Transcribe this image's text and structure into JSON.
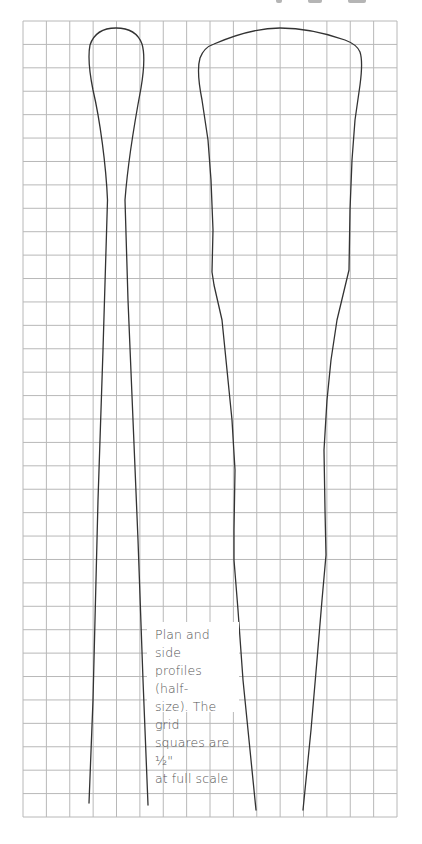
{
  "figure": {
    "caption": "Plan and side\nprofiles (half-\nsize). The grid\nsquares are ½\"\nat full scale",
    "caption_lines": [
      "Plan and side",
      "profiles (half-",
      "size). The grid",
      "squares are ½\"",
      "at full scale"
    ],
    "grid": {
      "columns": 16,
      "rows": 34,
      "x0": 23,
      "y0": 21,
      "x1": 397,
      "y1": 817,
      "line_color": "#b8b8b8"
    },
    "profiles": [
      {
        "name": "Plan profile",
        "stroke": "#333333"
      },
      {
        "name": "Side profile",
        "stroke": "#333333"
      }
    ],
    "colors": {
      "background": "#ffffff",
      "grid": "#b8b8b8",
      "outline": "#333333",
      "caption_text": "#555555"
    }
  }
}
